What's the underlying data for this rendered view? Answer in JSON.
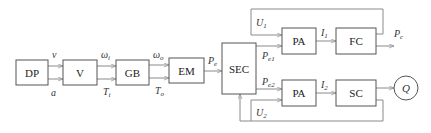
{
  "diagram": {
    "type": "block-diagram",
    "blocks": [
      {
        "id": "DP",
        "label": "DP"
      },
      {
        "id": "V",
        "label": "V"
      },
      {
        "id": "GB",
        "label": "GB"
      },
      {
        "id": "EM",
        "label": "EM"
      },
      {
        "id": "SEC",
        "label": "SEC"
      },
      {
        "id": "PA1",
        "label": "PA"
      },
      {
        "id": "FC",
        "label": "FC"
      },
      {
        "id": "PA2",
        "label": "PA"
      },
      {
        "id": "SC",
        "label": "SC"
      },
      {
        "id": "Q",
        "label": "Q"
      }
    ],
    "signals": {
      "v": {
        "main": "v",
        "sub": ""
      },
      "a": {
        "main": "a",
        "sub": ""
      },
      "omega_i": {
        "main": "ω",
        "sub": "i"
      },
      "T_i": {
        "main": "T",
        "sub": "i"
      },
      "omega_o": {
        "main": "ω",
        "sub": "o"
      },
      "T_o": {
        "main": "T",
        "sub": "o"
      },
      "P_e": {
        "main": "P",
        "sub": "e"
      },
      "P_e1": {
        "main": "P",
        "sub": "e1"
      },
      "P_e2": {
        "main": "P",
        "sub": "e2"
      },
      "U_1": {
        "main": "U",
        "sub": "1"
      },
      "U_2": {
        "main": "U",
        "sub": "2"
      },
      "I_1": {
        "main": "I",
        "sub": "1"
      },
      "I_2": {
        "main": "I",
        "sub": "2"
      },
      "P_c": {
        "main": "P",
        "sub": "c"
      }
    },
    "edges": [
      {
        "from": "DP",
        "to": "V",
        "labels": [
          "v",
          "a"
        ]
      },
      {
        "from": "V",
        "to": "GB",
        "labels": [
          "ω_i",
          "T_i"
        ]
      },
      {
        "from": "GB",
        "to": "EM",
        "labels": [
          "ω_o",
          "T_o"
        ]
      },
      {
        "from": "EM",
        "to": "SEC",
        "labels": [
          "P_e"
        ]
      },
      {
        "from": "SEC",
        "to": "PA1",
        "labels": [
          "P_e1"
        ]
      },
      {
        "from": "SEC",
        "to": "PA2",
        "labels": [
          "P_e2"
        ]
      },
      {
        "from": "PA1",
        "to": "FC",
        "labels": [
          "I_1"
        ]
      },
      {
        "from": "PA2",
        "to": "SC",
        "labels": [
          "I_2"
        ]
      },
      {
        "from": "FC",
        "to": "output",
        "labels": [
          "P_c"
        ]
      },
      {
        "from": "FC",
        "to": "PA1",
        "labels": [
          "U_1"
        ],
        "kind": "feedback"
      },
      {
        "from": "SC",
        "to": "Q",
        "labels": []
      },
      {
        "from": "SC",
        "to": "PA2",
        "labels": [
          "U_2"
        ],
        "kind": "feedback"
      },
      {
        "from": "SC",
        "to": "SEC",
        "labels": [],
        "kind": "feedback"
      }
    ]
  }
}
